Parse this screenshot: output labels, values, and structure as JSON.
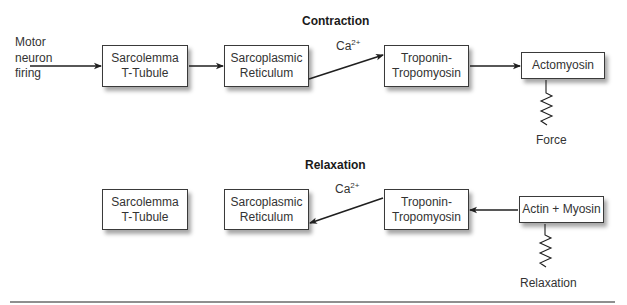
{
  "contraction": {
    "title": "Contraction",
    "input_label": [
      "Motor",
      "neuron",
      "firing"
    ],
    "boxes": [
      {
        "id": "sarcolemma",
        "lines": [
          "Sarcolemma",
          "T-Tubule"
        ]
      },
      {
        "id": "sarcoplasmic",
        "lines": [
          "Sarcoplasmic",
          "Reticulum"
        ]
      },
      {
        "id": "troponin",
        "lines": [
          "Troponin-",
          "Tropomyosin"
        ]
      },
      {
        "id": "actomyosin",
        "lines": [
          "Actomyosin"
        ]
      }
    ],
    "ion_label": {
      "base": "Ca",
      "sup": "2+"
    },
    "output_label": "Force",
    "flow": [
      {
        "from": "motor-neuron",
        "to": "sarcolemma"
      },
      {
        "from": "sarcolemma",
        "to": "sarcoplasmic"
      },
      {
        "from": "sarcoplasmic",
        "to": "troponin",
        "label": "Ca2+"
      },
      {
        "from": "troponin",
        "to": "actomyosin"
      },
      {
        "from": "actomyosin",
        "to": "force",
        "connector": "spring"
      }
    ]
  },
  "relaxation": {
    "title": "Relaxation",
    "boxes": [
      {
        "id": "sarcolemma",
        "lines": [
          "Sarcolemma",
          "T-Tubule"
        ]
      },
      {
        "id": "sarcoplasmic",
        "lines": [
          "Sarcoplasmic",
          "Reticulum"
        ]
      },
      {
        "id": "troponin",
        "lines": [
          "Troponin-",
          "Tropomyosin"
        ]
      },
      {
        "id": "actin-myosin",
        "lines": [
          "Actin + Myosin"
        ]
      }
    ],
    "ion_label": {
      "base": "Ca",
      "sup": "2+"
    },
    "output_label": "Relaxation",
    "flow": [
      {
        "from": "actin-myosin",
        "to": "troponin"
      },
      {
        "from": "troponin",
        "to": "sarcoplasmic",
        "label": "Ca2+"
      },
      {
        "from": "actin-myosin",
        "to": "relaxation",
        "connector": "spring"
      }
    ]
  },
  "colors": {
    "line": "#1f1f1f",
    "box_border": "#3a3a3a",
    "text": "#333333",
    "rule": "#6a6a6a"
  }
}
